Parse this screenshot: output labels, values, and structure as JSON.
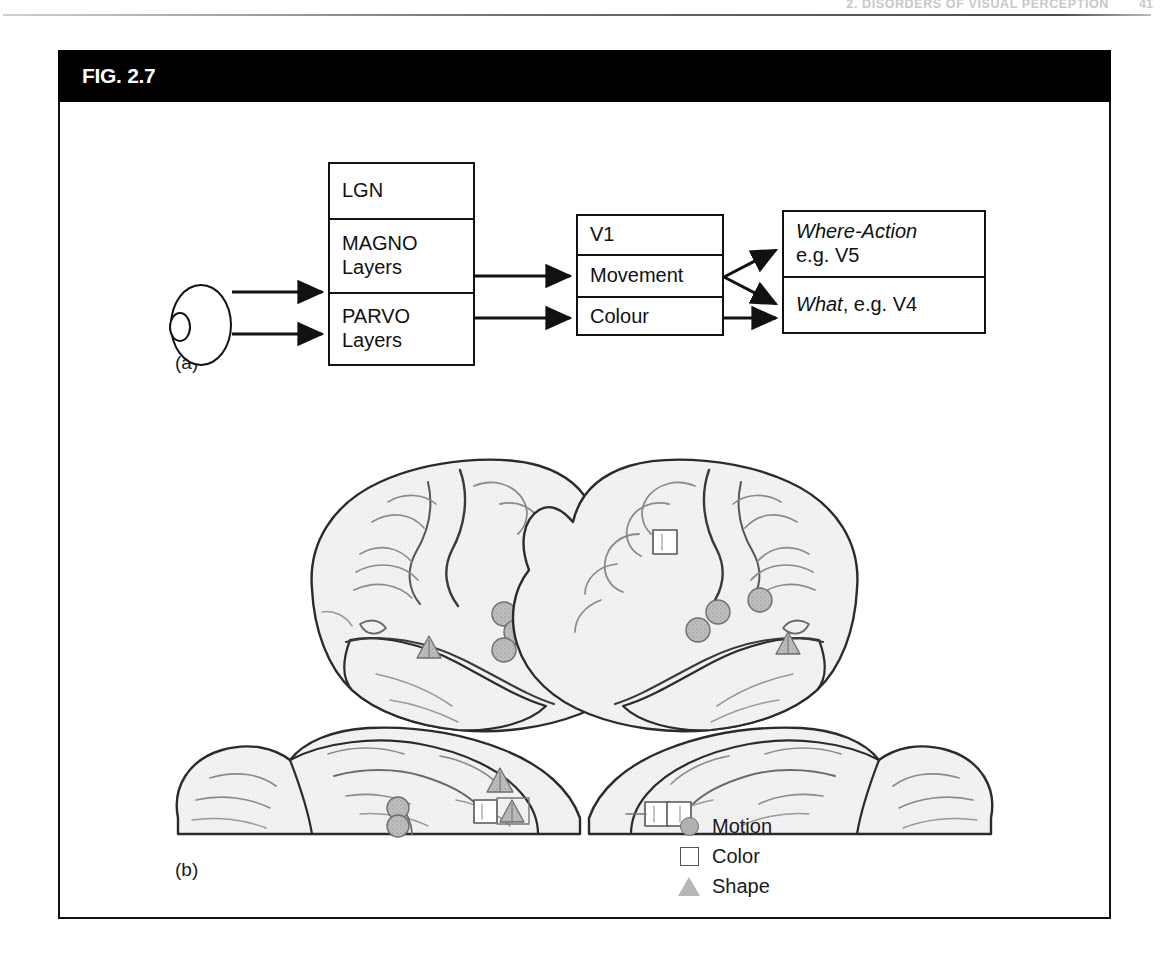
{
  "running_head": {
    "text": "2. DISORDERS OF VISUAL PERCEPTION",
    "page": "41"
  },
  "figure": {
    "label": "FIG. 2.7",
    "panel_a_label": "(a)",
    "panel_b_label": "(b)"
  },
  "flow_diagram": {
    "eye_name": "eye",
    "lgn_box": {
      "rows": [
        {
          "line1": "LGN",
          "line2": ""
        },
        {
          "line1": "MAGNO",
          "line2": "Layers"
        },
        {
          "line1": "PARVO",
          "line2": "Layers"
        }
      ]
    },
    "v1_box": {
      "rows": [
        {
          "line1": "V1"
        },
        {
          "line1": "Movement"
        },
        {
          "line1": "Colour"
        }
      ]
    },
    "output_box": {
      "rows": [
        {
          "italic": "Where-Action",
          "plain": "e.g. V5"
        },
        {
          "italic": "What",
          "plain": ", e.g. V4"
        }
      ]
    }
  },
  "brain_panel": {
    "legend": [
      {
        "symbol": "circle",
        "label": "Motion"
      },
      {
        "symbol": "square",
        "label": "Color"
      },
      {
        "symbol": "triangle",
        "label": "Shape"
      }
    ]
  },
  "colors": {
    "banner_bg": "#000000",
    "banner_text": "#ffffff",
    "frame_border": "#111111",
    "brain_fill": "#f2f2f2",
    "brain_outline": "#2b2b2b",
    "motion_symbol": "#b0b0b0",
    "color_symbol": "#ffffff",
    "shape_symbol": "#b6b6b6"
  }
}
